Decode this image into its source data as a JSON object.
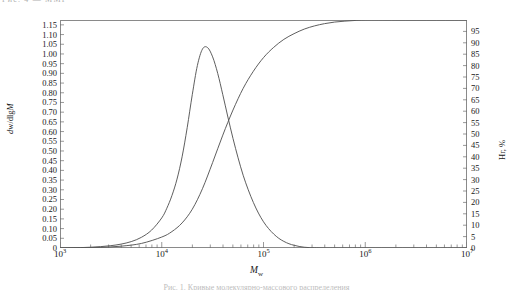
{
  "figure": {
    "top_clipped_text": "Рис. 4 — ММР",
    "caption_clipped_text": "Рис. 1. Кривые молекулярно-массового распределения"
  },
  "chart_data": {
    "type": "line",
    "title": "",
    "xlabel": "M",
    "xlabel_sub": "w",
    "xscale": "log",
    "xlim": [
      1000,
      10000000
    ],
    "xtick_labels": [
      "10",
      "10",
      "10",
      "10",
      "10"
    ],
    "xtick_exponents": [
      "3",
      "4",
      "5",
      "6",
      "7"
    ],
    "xtick_values": [
      1000,
      10000,
      100000,
      1000000,
      10000000
    ],
    "ylabel_left": "dw/dlgM",
    "ylim_left": [
      0,
      1.175
    ],
    "ytick_left": [
      "0",
      "0.05",
      "0.10",
      "0.15",
      "0.20",
      "0.25",
      "0.30",
      "0.35",
      "0.40",
      "0.45",
      "0.50",
      "0.55",
      "0.60",
      "0.65",
      "0.70",
      "0.75",
      "0.80",
      "0.85",
      "0.90",
      "0.95",
      "1.00",
      "1.05",
      "1.10",
      "1.15"
    ],
    "ytick_left_values": [
      0,
      0.05,
      0.1,
      0.15,
      0.2,
      0.25,
      0.3,
      0.35,
      0.4,
      0.45,
      0.5,
      0.55,
      0.6,
      0.65,
      0.7,
      0.75,
      0.8,
      0.85,
      0.9,
      0.95,
      1.0,
      1.05,
      1.1,
      1.15
    ],
    "ylabel_right": "Нг, %",
    "ylim_right": [
      0,
      100
    ],
    "ytick_right": [
      "0",
      "5",
      "10",
      "15",
      "20",
      "25",
      "30",
      "35",
      "40",
      "45",
      "50",
      "55",
      "60",
      "65",
      "70",
      "75",
      "80",
      "85",
      "90",
      "95"
    ],
    "ytick_right_values": [
      0,
      5,
      10,
      15,
      20,
      25,
      30,
      35,
      40,
      45,
      50,
      55,
      60,
      65,
      70,
      75,
      80,
      85,
      90,
      95
    ],
    "grid": false,
    "legend": "none",
    "series": [
      {
        "name": "differential distribution dw/dlgM",
        "axis": "left",
        "color": "#555555",
        "points": [
          [
            1000,
            0.0
          ],
          [
            1259,
            0.001
          ],
          [
            1585,
            0.002
          ],
          [
            1995,
            0.004
          ],
          [
            2512,
            0.007
          ],
          [
            3162,
            0.012
          ],
          [
            3981,
            0.02
          ],
          [
            5012,
            0.033
          ],
          [
            6310,
            0.055
          ],
          [
            7943,
            0.092
          ],
          [
            10000,
            0.155
          ],
          [
            11220,
            0.205
          ],
          [
            12589,
            0.27
          ],
          [
            14125,
            0.355
          ],
          [
            15849,
            0.47
          ],
          [
            17783,
            0.62
          ],
          [
            19953,
            0.79
          ],
          [
            22387,
            0.94
          ],
          [
            25119,
            1.025
          ],
          [
            28184,
            1.033
          ],
          [
            31623,
            0.985
          ],
          [
            35481,
            0.9
          ],
          [
            39811,
            0.79
          ],
          [
            44668,
            0.675
          ],
          [
            50119,
            0.565
          ],
          [
            56234,
            0.465
          ],
          [
            63096,
            0.375
          ],
          [
            70795,
            0.3
          ],
          [
            79433,
            0.235
          ],
          [
            89125,
            0.18
          ],
          [
            100000,
            0.135
          ],
          [
            112202,
            0.1
          ],
          [
            125893,
            0.072
          ],
          [
            141254,
            0.05
          ],
          [
            158489,
            0.034
          ],
          [
            177828,
            0.022
          ],
          [
            199526,
            0.014
          ],
          [
            223872,
            0.008
          ],
          [
            251189,
            0.004
          ],
          [
            281838,
            0.002
          ],
          [
            316228,
            0.001
          ],
          [
            398107,
            0.0
          ],
          [
            501187,
            0.0
          ],
          [
            1000000,
            0.0
          ],
          [
            10000000,
            0.0
          ]
        ]
      },
      {
        "name": "cumulative distribution Нг (%)",
        "axis": "right",
        "color": "#555555",
        "points": [
          [
            1000,
            0.0
          ],
          [
            1585,
            0.1
          ],
          [
            2512,
            0.3
          ],
          [
            3981,
            0.8
          ],
          [
            6310,
            2.0
          ],
          [
            10000,
            4.8
          ],
          [
            12589,
            7.2
          ],
          [
            15849,
            11.0
          ],
          [
            19953,
            17.0
          ],
          [
            25119,
            26.0
          ],
          [
            31623,
            37.5
          ],
          [
            39811,
            49.5
          ],
          [
            50119,
            60.5
          ],
          [
            63096,
            70.0
          ],
          [
            79433,
            77.5
          ],
          [
            100000,
            83.5
          ],
          [
            125893,
            88.0
          ],
          [
            158489,
            91.5
          ],
          [
            199526,
            94.0
          ],
          [
            251189,
            96.0
          ],
          [
            316228,
            97.4
          ],
          [
            398107,
            98.4
          ],
          [
            501187,
            99.1
          ],
          [
            630957,
            99.5
          ],
          [
            794328,
            99.8
          ],
          [
            1000000,
            100.0
          ],
          [
            2000000,
            100.0
          ],
          [
            5000000,
            100.0
          ],
          [
            10000000,
            100.0
          ]
        ]
      }
    ]
  }
}
